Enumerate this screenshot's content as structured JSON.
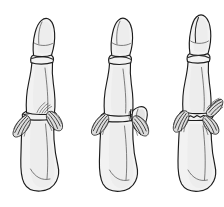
{
  "figure": {
    "background_color": "#ffffff",
    "width": 224,
    "height": 207,
    "style": "line drawing",
    "panel_count": 3,
    "colors": {
      "outline": "#1d1d1d",
      "bone_fill": "#f2f2f2",
      "bone_shade": "#e4e4e4",
      "ligament_fill": "#dcdcdc",
      "ligament_fiber": "#1c1c1c",
      "background": "#ffffff"
    },
    "panels": [
      {
        "id": "panel-left",
        "label": "",
        "position_x": 30,
        "description": "Finger in dorsal view with intact proximal interphalangeal joint and fanned collateral ligaments on both sides of the joint",
        "joint_state": "intact",
        "fracture": "none",
        "ligaments": [
          "radial collateral ligament",
          "ulnar collateral ligament"
        ],
        "segments": [
          "distal phalanx",
          "middle phalanx",
          "proximal phalanx"
        ]
      },
      {
        "id": "panel-middle",
        "label": "",
        "position_x": 112,
        "description": "Finger with avulsed bone fragment displaced laterally, collateral ligament still attached to the detached fragment",
        "joint_state": "avulsion fracture",
        "fracture": "lateral condylar avulsion fragment, displaced",
        "ligaments": [
          "collateral ligament attached to avulsed fragment",
          "contralateral collateral ligament"
        ],
        "segments": [
          "distal phalanx",
          "middle phalanx",
          "proximal phalanx"
        ]
      },
      {
        "id": "panel-right",
        "label": "",
        "position_x": 190,
        "description": "Finger with transverse fracture line across the base of the phalanx and collateral ligaments fanning from both sides",
        "joint_state": "transverse fracture at base",
        "fracture": "transverse, non-displaced",
        "ligaments": [
          "radial collateral ligament",
          "ulnar collateral ligament"
        ],
        "segments": [
          "distal phalanx",
          "middle phalanx",
          "proximal phalanx"
        ]
      }
    ]
  }
}
